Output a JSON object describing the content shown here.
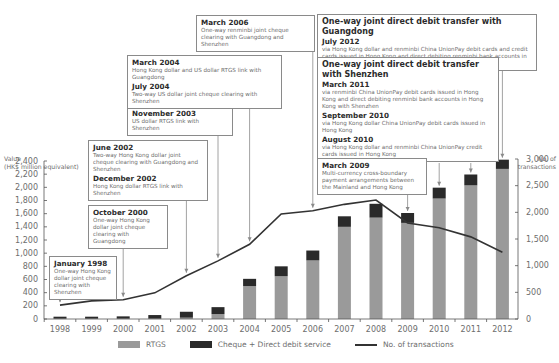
{
  "chart_data": {
    "type": "bar",
    "title": "",
    "categories": [
      "1998",
      "1999",
      "2000",
      "2001",
      "2002",
      "2003",
      "2004",
      "2005",
      "2006",
      "2007",
      "2008",
      "2009",
      "2010",
      "2011",
      "2012"
    ],
    "series": [
      {
        "name": "RTGS",
        "type": "bar",
        "stacked": true,
        "axis": "left",
        "color": "#9a9a9a",
        "values": [
          5,
          5,
          5,
          5,
          20,
          75,
          500,
          650,
          890,
          1400,
          1540,
          1460,
          1830,
          2030,
          2280
        ]
      },
      {
        "name": "Cheque + Direct debit service",
        "type": "bar",
        "stacked": true,
        "axis": "left",
        "color": "#2a2a2a",
        "values": [
          30,
          30,
          35,
          55,
          90,
          105,
          110,
          150,
          150,
          160,
          210,
          150,
          165,
          165,
          140
        ]
      },
      {
        "name": "No. of transactions",
        "type": "line",
        "axis": "right",
        "color": "#333333",
        "values": [
          260,
          340,
          360,
          490,
          810,
          1090,
          1400,
          1970,
          2030,
          2150,
          2230,
          1800,
          1710,
          1540,
          1250
        ]
      }
    ],
    "ylabel": "Value (HK$ million equivalent)",
    "ylabel_right": "No. of transactions",
    "ylim": [
      0,
      2400
    ],
    "ylim_right": [
      0,
      3000
    ],
    "yticks": [
      0,
      200,
      400,
      600,
      800,
      1000,
      1200,
      1400,
      1600,
      1800,
      2000,
      2200,
      2400
    ],
    "yticks_right": [
      0,
      500,
      1000,
      1500,
      2000,
      2500,
      3000
    ],
    "grid": false,
    "legend_position": "bottom"
  },
  "axes": {
    "left_title_1": "Value",
    "left_title_2": "(HK$ million equivalent)",
    "right_title_1": "No. of",
    "right_title_2": "transactions",
    "left_ticks": [
      "2,400",
      "2,200",
      "2,000",
      "1,800",
      "1,600",
      "1,400",
      "1,200",
      "1,000",
      "800",
      "600",
      "400",
      "200",
      "0"
    ],
    "right_ticks": [
      "3,000",
      "2,500",
      "2,000",
      "1,500",
      "1,000",
      "500",
      "0"
    ]
  },
  "legend": {
    "rtgs": "RTGS",
    "cheque": "Cheque + Direct debit service",
    "line": "No. of transactions"
  },
  "annotations": {
    "jan1998": {
      "date": "January 1998",
      "text": "One-way Hong Kong dollar joint cheque clearing with Shenzhen"
    },
    "oct2000": {
      "date": "October 2000",
      "text": "One-way Hong Kong dollar joint cheque clearing with Guangdong"
    },
    "jun2002": {
      "date": "June 2002",
      "text": "Two-way Hong Kong dollar joint cheque clearing with Guangdong and Shenzhen"
    },
    "dec2002": {
      "date": "December 2002",
      "text": "Hong Kong dollar RTGS link with Shenzhen"
    },
    "nov2003": {
      "date": "November 2003",
      "text": "US dollar RTGS link with Shenzhen"
    },
    "mar2004": {
      "date": "March 2004",
      "text": "Hong Kong dollar and US dollar RTGS link with Guangdong"
    },
    "jul2004": {
      "date": "July 2004",
      "text": "Two-way US dollar joint cheque clearing with Shenzhen"
    },
    "mar2006": {
      "date": "March 2006",
      "text": "One-way renminbi joint cheque clearing with Guangdong and Shenzhen"
    },
    "guangdong": {
      "heading": "One-way joint direct debit transfer with Guangdong",
      "date": "July 2012",
      "text": "via Hong Kong dollar and renminbi China UnionPay debit cards and credit cards issued in Hong Kong and direct debiting renminbi bank accounts in Hong Kong"
    },
    "shenzhen": {
      "heading": "One-way joint direct debit transfer with Shenzhen",
      "items": [
        {
          "date": "March 2011",
          "text": "via renminbi China UnionPay debit cards issued in Hong Kong and direct debiting renminbi bank accounts in Hong Kong with Shenzhen"
        },
        {
          "date": "September 2010",
          "text": "via Hong Kong dollar China UnionPay debit cards issued in Hong Kong"
        },
        {
          "date": "August 2010",
          "text": "via Hong Kong dollar and renminbi China UnionPay credit cards issued in Hong Kong"
        }
      ]
    },
    "mar2009": {
      "date": "March 2009",
      "text": "Multi-currency cross-boundary payment arrangements between the Mainland and Hong Kong"
    }
  }
}
